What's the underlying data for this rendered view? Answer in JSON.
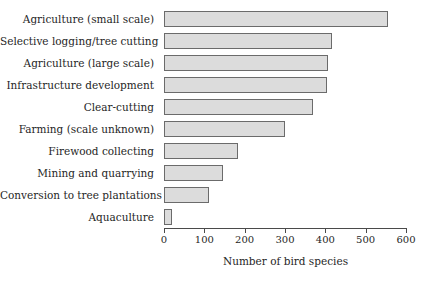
{
  "chart_data": {
    "type": "bar",
    "orientation": "horizontal",
    "title": "",
    "subtitle": "",
    "xlabel": "Number of bird species",
    "ylabel": "",
    "xlim": [
      0,
      600
    ],
    "xticks": [
      0,
      100,
      200,
      300,
      400,
      500,
      600
    ],
    "xtick_labels": [
      "0",
      "100",
      "200",
      "300",
      "400",
      "500",
      "600"
    ],
    "grid": false,
    "legend": null,
    "categories": [
      "Agriculture (small scale)",
      "Selective logging/tree cutting",
      "Agriculture (large scale)",
      "Infrastructure development",
      "Clear-cutting",
      "Farming (scale unknown)",
      "Firewood collecting",
      "Mining and quarrying",
      "Conversion to tree plantations",
      "Aquaculture"
    ],
    "values": [
      555,
      417,
      407,
      403,
      370,
      300,
      183,
      147,
      112,
      20
    ],
    "bar_fill_color": "#dcdcdc",
    "bar_edge_color": "#6b6b6b",
    "axis_color": "#4a4a4a",
    "background_color": "#ffffff"
  }
}
